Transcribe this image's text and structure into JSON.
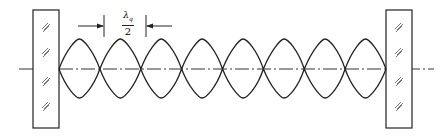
{
  "diagram": {
    "type": "standing-wave-resonator",
    "loop_count": 8,
    "dimension_label": {
      "symbol": "λ",
      "subscript": "q",
      "denominator": "2"
    },
    "colors": {
      "stroke": "#222222",
      "background": "#ffffff"
    }
  }
}
